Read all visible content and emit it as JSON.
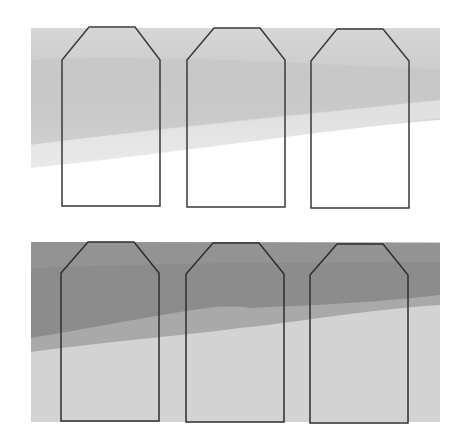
{
  "diagram": {
    "type": "paired comparison illustration",
    "panels": [
      {
        "id": "top",
        "description": "light gray shaded band fading to white, with three pentagon (tag-shaped) outlines",
        "shape_count": 3,
        "colors": {
          "band_top": "#d6d6d6",
          "band_mid": "#c6c6c6",
          "band_fade": "#ebebeb",
          "outline": "#3a3a3a",
          "below": "#ffffff"
        }
      },
      {
        "id": "bottom",
        "description": "darker gray banded field with three pentagon (tag-shaped) outlines",
        "shape_count": 3,
        "colors": {
          "band_dark": "#8c8c8c",
          "band_mid": "#a9a9a9",
          "band_light": "#d3d3d3",
          "outline": "#2e2e2e"
        }
      }
    ],
    "shape_x_positions": [
      61,
      186,
      310
    ],
    "shape_width": 98
  }
}
